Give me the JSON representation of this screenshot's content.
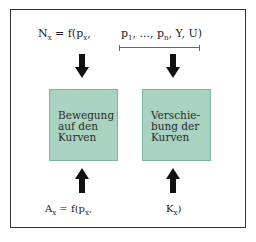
{
  "diagram": {
    "top_formula": {
      "left": {
        "var": "N",
        "sub": "x",
        "rest": " = f(p",
        "sub2": "x",
        "tail": ","
      },
      "right": {
        "p1": "p",
        "p1_sub": "1",
        "mid": ", ..., p",
        "pn_sub": "n",
        "tail": ", Y, U)"
      }
    },
    "boxes": [
      {
        "lines": [
          "Bewegung",
          "auf den",
          "Kurven"
        ]
      },
      {
        "lines": [
          "Verschie-",
          "bung der",
          "Kurven"
        ]
      }
    ],
    "bottom_formula": {
      "left": {
        "var": "A",
        "sub": "x",
        "rest": " = f(p",
        "sub2": "x",
        "tail": ","
      },
      "right": {
        "var": "K",
        "sub": "x",
        "tail": ")"
      }
    },
    "colors": {
      "box_fill": "#a9d3c0",
      "box_border": "#7fb39c",
      "arrow": "#111111",
      "frame": "#333333"
    }
  }
}
